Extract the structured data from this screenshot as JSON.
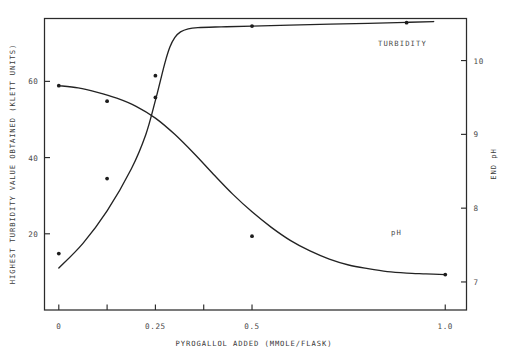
{
  "chart_data": {
    "type": "line",
    "title": "",
    "xlabel": "PYROGALLOL ADDED (MMOLE/FLASK)",
    "ylabel": "HIGHEST TURBIDITY VALUE OBTAINED (KLETT UNITS)",
    "ylabel_right": "END pH",
    "xlim": [
      -0.037,
      1.055
    ],
    "ylim_left": [
      0,
      76.5
    ],
    "ylim_right": [
      6.62,
      10.57
    ],
    "grid": false,
    "legend_position": "inline-annotation",
    "xticks": [
      0,
      0.125,
      0.25,
      0.375,
      0.5,
      1.0
    ],
    "xticklabels": [
      "0",
      "",
      "0.25",
      "",
      "0.5",
      "1.0"
    ],
    "yticks_left": [
      20,
      40,
      60
    ],
    "yticklabels_left": [
      "20",
      "40",
      "60"
    ],
    "yticks_right": [
      7,
      8,
      9,
      10
    ],
    "yticklabels_right": [
      "7",
      "8",
      "9",
      "10"
    ],
    "series": [
      {
        "name": "TURBIDITY",
        "axis": "left",
        "units": "KLETT UNITS",
        "label": "TURBIDITY",
        "curve": [
          [
            0.0,
            11.0
          ],
          [
            0.0625,
            17.5
          ],
          [
            0.125,
            26.0
          ],
          [
            0.1875,
            37.0
          ],
          [
            0.225,
            46.0
          ],
          [
            0.25,
            55.0
          ],
          [
            0.2625,
            60.0
          ],
          [
            0.275,
            65.0
          ],
          [
            0.2875,
            69.0
          ],
          [
            0.3,
            71.5
          ],
          [
            0.315,
            73.0
          ],
          [
            0.335,
            73.8
          ],
          [
            0.36,
            74.1
          ],
          [
            0.42,
            74.3
          ],
          [
            0.5,
            74.5
          ],
          [
            0.65,
            74.9
          ],
          [
            0.8,
            75.2
          ],
          [
            0.9,
            75.5
          ],
          [
            0.97,
            75.7
          ]
        ],
        "points": [
          [
            0.0,
            14.8
          ],
          [
            0.125,
            34.5
          ],
          [
            0.25,
            61.5
          ],
          [
            0.5,
            74.5
          ],
          [
            0.9,
            75.4
          ]
        ]
      },
      {
        "name": "pH",
        "axis": "right",
        "units": "END pH",
        "label": "pH",
        "curve": [
          [
            0.0,
            9.66
          ],
          [
            0.05,
            9.63
          ],
          [
            0.1,
            9.57
          ],
          [
            0.15,
            9.49
          ],
          [
            0.2,
            9.38
          ],
          [
            0.25,
            9.22
          ],
          [
            0.3,
            9.0
          ],
          [
            0.35,
            8.74
          ],
          [
            0.4,
            8.46
          ],
          [
            0.45,
            8.19
          ],
          [
            0.5,
            7.95
          ],
          [
            0.55,
            7.74
          ],
          [
            0.6,
            7.56
          ],
          [
            0.65,
            7.42
          ],
          [
            0.7,
            7.31
          ],
          [
            0.75,
            7.23
          ],
          [
            0.8,
            7.18
          ],
          [
            0.85,
            7.14
          ],
          [
            0.9,
            7.12
          ],
          [
            0.95,
            7.11
          ],
          [
            1.0,
            7.1
          ]
        ],
        "points": [
          [
            0.0,
            9.66
          ],
          [
            0.125,
            9.45
          ],
          [
            0.25,
            9.5
          ],
          [
            0.5,
            7.62
          ],
          [
            1.0,
            7.1
          ]
        ]
      }
    ]
  },
  "annotations": {
    "turbidity_label": "TURBIDITY",
    "ph_label": "pH"
  },
  "colors": {
    "curve": "#232323",
    "frame": "#2b2b2b",
    "text": "#4a4a4a",
    "background": "#ffffff"
  }
}
